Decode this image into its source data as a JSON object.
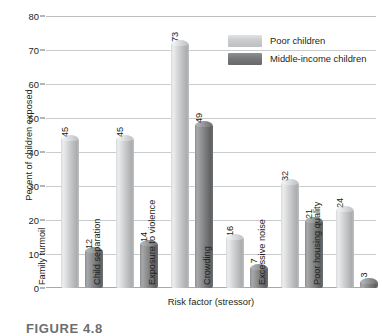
{
  "chart_data": {
    "type": "bar",
    "title": "",
    "xlabel": "Risk factor (stressor)",
    "ylabel": "Pecent of children exposed",
    "categories": [
      "Family turmoil",
      "Child separation",
      "Exposure to violence",
      "Crowding",
      "Excessive noise",
      "Poor housing quality"
    ],
    "series": [
      {
        "name": "Poor children",
        "values": [
          45,
          45,
          73,
          16,
          32,
          24
        ]
      },
      {
        "name": "Middle-income children",
        "values": [
          12,
          14,
          49,
          7,
          21,
          3
        ]
      }
    ],
    "ylim": [
      0,
      80
    ],
    "ytick_values": [
      80,
      70,
      60,
      50,
      40,
      30,
      20,
      10,
      0
    ],
    "grid": "horizontal",
    "legend_position": "top-right",
    "colors": {
      "poor_children": "#c6c7c9",
      "middle_income_children": "#76787a",
      "gridline": "#c9cbcd",
      "axis": "#a7a9ac",
      "text": "#231f20"
    }
  },
  "caption": {
    "figure_label": "FIGURE 4.8"
  }
}
